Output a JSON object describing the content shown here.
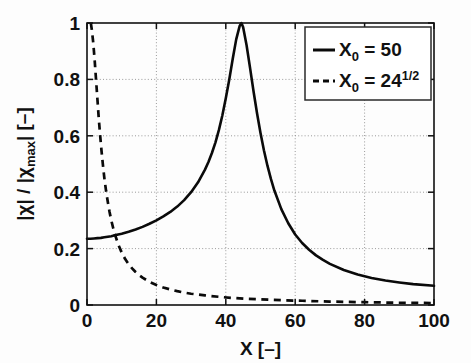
{
  "chart_data": {
    "type": "line",
    "title": "",
    "xlabel": "X   [–]",
    "ylabel": "|χ|  /  |χmax|   [–]",
    "ylabel_parts": {
      "main1": "|χ|  /  |χ",
      "sub": "max",
      "main2": "|   [–]"
    },
    "xlim": [
      0,
      100
    ],
    "ylim": [
      0,
      1
    ],
    "xticks": [
      0,
      20,
      40,
      60,
      80,
      100
    ],
    "xtick_labels": [
      "0",
      "20",
      "40",
      "60",
      "80",
      "100"
    ],
    "yticks": [
      0,
      0.2,
      0.4,
      0.6,
      0.8,
      1
    ],
    "ytick_labels": [
      "0",
      "0.2",
      "0.4",
      "0.6",
      "0.8",
      "1"
    ],
    "grid": true,
    "grid_style": "dotted",
    "legend_position": "top-right",
    "series": [
      {
        "name": "X_0 = 50",
        "label_main": "X",
        "label_sub": "0",
        "label_rest": " = 50",
        "label_sup": "",
        "style": "solid",
        "color": "#0a0a0a",
        "x": [
          0,
          1,
          2,
          3,
          4,
          5,
          6,
          7,
          8,
          9,
          10,
          12,
          14,
          16,
          18,
          20,
          22,
          24,
          26,
          28,
          30,
          32,
          34,
          35,
          36,
          37,
          38,
          39,
          40,
          41,
          42,
          43,
          44,
          44.5,
          45,
          46,
          47,
          48,
          49,
          50,
          51,
          52,
          53,
          54,
          56,
          58,
          60,
          62,
          64,
          66,
          68,
          70,
          74,
          78,
          82,
          86,
          90,
          94,
          100
        ],
        "y": [
          0.235,
          0.235,
          0.236,
          0.237,
          0.238,
          0.24,
          0.242,
          0.244,
          0.247,
          0.25,
          0.253,
          0.26,
          0.268,
          0.277,
          0.288,
          0.3,
          0.314,
          0.33,
          0.349,
          0.372,
          0.4,
          0.435,
          0.48,
          0.507,
          0.539,
          0.576,
          0.62,
          0.672,
          0.733,
          0.8,
          0.873,
          0.942,
          0.99,
          1.0,
          0.985,
          0.92,
          0.84,
          0.757,
          0.68,
          0.61,
          0.548,
          0.494,
          0.447,
          0.406,
          0.34,
          0.29,
          0.25,
          0.22,
          0.196,
          0.176,
          0.16,
          0.146,
          0.124,
          0.108,
          0.096,
          0.087,
          0.08,
          0.074,
          0.068
        ]
      },
      {
        "name": "X_0 = 24^(1/2)",
        "label_main": "X",
        "label_sub": "0",
        "label_rest": " = 24",
        "label_sup": "1/2",
        "style": "dashed",
        "color": "#0a0a0a",
        "x": [
          1.1,
          1.4,
          1.8,
          2.2,
          2.6,
          3,
          3.4,
          3.8,
          4.2,
          4.6,
          5,
          5.5,
          6,
          6.5,
          7,
          7.5,
          8,
          9,
          10,
          11,
          12,
          13,
          14,
          15,
          16,
          18,
          20,
          22,
          24,
          26,
          28,
          30,
          34,
          38,
          42,
          46,
          50,
          56,
          62,
          70,
          80,
          90,
          100
        ],
        "y": [
          1.0,
          0.975,
          0.93,
          0.87,
          0.8,
          0.73,
          0.66,
          0.6,
          0.545,
          0.495,
          0.45,
          0.404,
          0.365,
          0.33,
          0.3,
          0.275,
          0.252,
          0.215,
          0.186,
          0.163,
          0.145,
          0.13,
          0.117,
          0.106,
          0.097,
          0.082,
          0.071,
          0.062,
          0.055,
          0.049,
          0.044,
          0.04,
          0.034,
          0.029,
          0.025,
          0.022,
          0.02,
          0.017,
          0.015,
          0.012,
          0.01,
          0.008,
          0.007
        ]
      }
    ]
  },
  "plot_geometry": {
    "left": 87,
    "right": 434,
    "top": 23,
    "bottom": 305
  },
  "legend": {
    "box": {
      "x": 305,
      "y": 27,
      "width": 126,
      "height": 73
    }
  }
}
